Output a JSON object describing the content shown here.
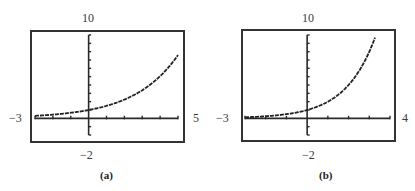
{
  "chart_data": [
    {
      "type": "line",
      "caption": "(a)",
      "function": "y = 1.5^x",
      "xlim": [
        -3,
        5
      ],
      "ylim": [
        -2,
        10
      ],
      "window_labels": {
        "ymax": "10",
        "ymin": "−2",
        "xmin": "−3",
        "xmax": "5"
      },
      "xscl": 1,
      "yscl": 1,
      "grid": false,
      "x": [
        -3,
        -2,
        -1,
        0,
        1,
        2,
        3,
        4,
        5
      ],
      "y": [
        0.3,
        0.44,
        0.67,
        1.0,
        1.5,
        2.25,
        3.38,
        5.06,
        7.59
      ]
    },
    {
      "type": "line",
      "caption": "(b)",
      "function": "y = 2^x",
      "xlim": [
        -3,
        4
      ],
      "ylim": [
        -2,
        10
      ],
      "window_labels": {
        "ymax": "10",
        "ymin": "−2",
        "xmin": "−3",
        "xmax": "4"
      },
      "xscl": 1,
      "yscl": 1,
      "grid": false,
      "x": [
        -3,
        -2,
        -1,
        0,
        1,
        2,
        3,
        3.32
      ],
      "y": [
        0.125,
        0.25,
        0.5,
        1.0,
        2.0,
        4.0,
        8.0,
        10.0
      ]
    }
  ],
  "panels": [
    {
      "caption": "(a)",
      "ymax": "10",
      "ymin": "−2",
      "xmin": "−3",
      "xmax": "5"
    },
    {
      "caption": "(b)",
      "ymax": "10",
      "ymin": "−2",
      "xmin": "−3",
      "xmax": "4"
    }
  ],
  "colors": {
    "frame": "#333333",
    "axis": "#2a2a2a",
    "curve": "#222222",
    "text": "#3a3a3a"
  }
}
